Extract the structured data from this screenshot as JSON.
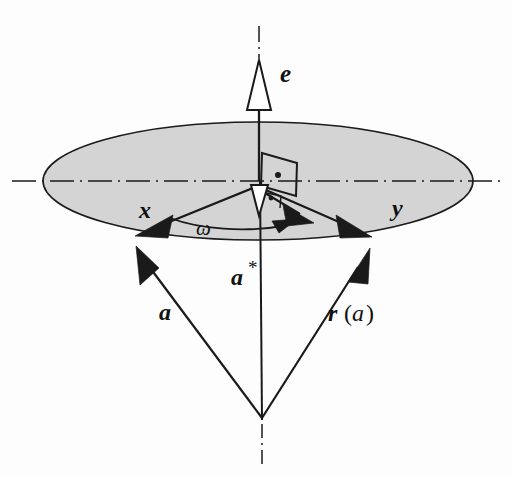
{
  "figure": {
    "kind": "vector-geometry-diagram",
    "background_color": "#fdfdfd",
    "ink_color": "#1a1a1a",
    "plane_fill_color": "#d4d4d4",
    "plane_edge_color": "#1a1a1a"
  },
  "labels": {
    "axis_vector": "e",
    "component_x": "x",
    "component_y": "y",
    "angle": "ω",
    "projection": "a",
    "projection_star": "*",
    "vector_a": "a",
    "rotated_vector_r": "r",
    "rotated_vector_open_paren": "(",
    "rotated_vector_arg": "a",
    "rotated_vector_close_paren": ")"
  },
  "geometry": {
    "apex": {
      "x": 262,
      "y": 420
    },
    "center": {
      "x": 258,
      "y": 181
    },
    "ellipse_rx": 215,
    "ellipse_ry": 59,
    "axis_top_y": 28,
    "axis_bottom_y": 462,
    "horizontal_axis_left_x": 12,
    "horizontal_axis_right_x": 502,
    "tip_x": {
      "x": 135,
      "y": 236
    },
    "tip_y": {
      "x": 372,
      "y": 237
    },
    "angle_label_deg": 175
  },
  "elements": [
    {
      "name": "rotation-plane-ellipse",
      "role": "shaded elliptical disc representing the plane perpendicular to e"
    },
    {
      "name": "axis-e-arrow",
      "role": "upward hollow arrow labelled e"
    },
    {
      "name": "projection-a-star-arrow",
      "role": "small downward hollow arrow labelled a*"
    },
    {
      "name": "vector-x-arrow",
      "role": "solid arrow from center to left rim labelled x"
    },
    {
      "name": "vector-y-arrow",
      "role": "solid arrow from center to right rim labelled y"
    },
    {
      "name": "angle-arc-omega",
      "role": "arc with arrowhead marking the rotation angle omega"
    },
    {
      "name": "vector-a-line",
      "role": "line from apex to left rim labelled a"
    },
    {
      "name": "vector-ra-line",
      "role": "line from apex to right rim labelled r(a)"
    },
    {
      "name": "right-angle-marker",
      "role": "perpendicularity marker with dot at the center"
    }
  ]
}
